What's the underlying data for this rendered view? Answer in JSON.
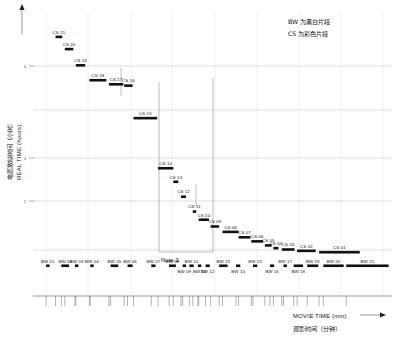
{
  "legend": {
    "line1": "BW 为黑白片段",
    "line2": "CS 为彩色片段"
  },
  "axes": {
    "y_label_en": "REAL TIME (hours)",
    "y_label_cn": "电影放映时间（小时）",
    "x_label_en": "MOVIE TIME (min)",
    "x_label_cn": "观影时间（分钟）",
    "y_ticks": [
      "4",
      "3",
      "2",
      "1"
    ],
    "x_ticks": []
  },
  "annotations": {
    "note3": "Note 3"
  },
  "chart_data": {
    "type": "scatter",
    "title": "",
    "xlabel": "MOVIE TIME (min)",
    "ylabel": "REAL TIME (hours)",
    "xlim": [
      0,
      100
    ],
    "ylim": [
      0,
      100
    ],
    "grid": true,
    "legend_position": "top-right",
    "series": [
      {
        "name": "CS",
        "description": "彩色片段",
        "color": "#111111",
        "points": [
          {
            "label": "CS 21",
            "x": 11.5,
            "y": 84.5,
            "w": 4.0
          },
          {
            "label": "CS 20",
            "x": 17.0,
            "y": 80.0,
            "w": 5.0
          },
          {
            "label": "CS 19",
            "x": 23.5,
            "y": 74.0,
            "w": 5.5
          },
          {
            "label": "CS 18",
            "x": 31.5,
            "y": 68.5,
            "w": 10.0
          },
          {
            "label": "CS 17",
            "x": 43.0,
            "y": 67.0,
            "w": 8.5
          },
          {
            "label": "CS 16",
            "x": 52.0,
            "y": 66.5,
            "w": 5.0
          },
          {
            "label": "CS 15",
            "x": 57.5,
            "y": 54.5,
            "w": 14.0
          },
          {
            "label": "CS 14",
            "x": 72.0,
            "y": 36.0,
            "w": 9.0
          },
          {
            "label": "CS 13",
            "x": 81.0,
            "y": 31.0,
            "w": 3.0
          },
          {
            "label": "CS 12",
            "x": 85.5,
            "y": 25.5,
            "w": 3.0
          },
          {
            "label": "CS 11",
            "x": 92.5,
            "y": 20.0,
            "w": 2.0
          },
          {
            "label": "CS 10",
            "x": 96.0,
            "y": 17.0,
            "w": 6.0
          },
          {
            "label": "CS 09",
            "x": 103.0,
            "y": 14.5,
            "w": 5.0
          },
          {
            "label": "CS 08",
            "x": 110.0,
            "y": 12.5,
            "w": 9.5
          },
          {
            "label": "CS 07",
            "x": 119.5,
            "y": 10.5,
            "w": 7.0
          },
          {
            "label": "CS 06",
            "x": 127.0,
            "y": 9.0,
            "w": 7.0
          },
          {
            "label": "CS 05",
            "x": 135.0,
            "y": 7.5,
            "w": 4.0
          },
          {
            "label": "CS 04",
            "x": 140.0,
            "y": 6.5,
            "w": 3.0
          },
          {
            "label": "CS 03",
            "x": 145.0,
            "y": 6.0,
            "w": 7.5
          },
          {
            "label": "CS 02",
            "x": 154.0,
            "y": 5.5,
            "w": 11.0
          },
          {
            "label": "CS 01",
            "x": 167.0,
            "y": 5.0,
            "w": 24.0
          }
        ]
      },
      {
        "name": "BW",
        "description": "黑白片段",
        "color": "#111111",
        "points": [
          {
            "label": "BW 01",
            "x": 6.0,
            "y": 0.0,
            "w": 2.0
          },
          {
            "label": "BW 02",
            "x": 15.0,
            "y": 0.0,
            "w": 4.5
          },
          {
            "label": "BW 03",
            "x": 23.0,
            "y": 0.0,
            "w": 2.0
          },
          {
            "label": "BW 04",
            "x": 32.0,
            "y": 0.0,
            "w": 2.0
          },
          {
            "label": "BW 05",
            "x": 44.0,
            "y": 0.0,
            "w": 4.5
          },
          {
            "label": "BW 06",
            "x": 54.0,
            "y": 0.0,
            "w": 3.0
          },
          {
            "label": "BW 07",
            "x": 68.0,
            "y": 0.0,
            "w": 2.5
          },
          {
            "label": "BW 08",
            "x": 78.5,
            "y": 0.0,
            "w": 4.0
          },
          {
            "label": "BW 09",
            "x": 86.5,
            "y": 0.0,
            "w": 2.0
          },
          {
            "label": "BW 10",
            "x": 90.5,
            "y": 0.0,
            "w": 2.5
          },
          {
            "label": "BW 11",
            "x": 95.5,
            "y": 0.0,
            "w": 2.0
          },
          {
            "label": "BW 12",
            "x": 100.0,
            "y": 0.0,
            "w": 2.5
          },
          {
            "label": "BW 13",
            "x": 108.0,
            "y": 0.0,
            "w": 5.0
          },
          {
            "label": "BW 14",
            "x": 118.0,
            "y": 0.0,
            "w": 2.5
          },
          {
            "label": "BW 15",
            "x": 128.0,
            "y": 0.0,
            "w": 2.5
          },
          {
            "label": "BW 16",
            "x": 138.0,
            "y": 0.0,
            "w": 2.5
          },
          {
            "label": "BW 17",
            "x": 146.0,
            "y": 0.0,
            "w": 2.0
          },
          {
            "label": "BW 18",
            "x": 152.0,
            "y": 0.0,
            "w": 5.5
          },
          {
            "label": "BW 19",
            "x": 160.0,
            "y": 0.0,
            "w": 6.5
          },
          {
            "label": "BW 20",
            "x": 169.5,
            "y": 0.0,
            "w": 12.0
          },
          {
            "label": "BW 21",
            "x": 183.0,
            "y": 0.0,
            "w": 25.0
          }
        ]
      }
    ]
  }
}
